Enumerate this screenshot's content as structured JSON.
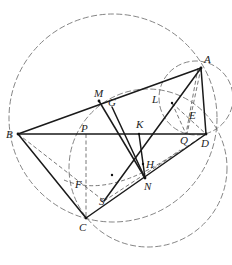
{
  "diagram": {
    "type": "geometry-construction",
    "points": {
      "A": {
        "label": "A",
        "x": 201,
        "y": 68
      },
      "B": {
        "label": "B",
        "x": 18,
        "y": 134
      },
      "C": {
        "label": "C",
        "x": 86,
        "y": 218
      },
      "D": {
        "label": "D",
        "x": 206,
        "y": 134
      },
      "M": {
        "label": "M",
        "x": 99,
        "y": 101
      },
      "G": {
        "label": "G",
        "x": 112,
        "y": 107
      },
      "K": {
        "label": "K",
        "x": 139,
        "y": 134
      },
      "H": {
        "label": "H",
        "x": 143,
        "y": 164
      },
      "N": {
        "label": "N",
        "x": 145,
        "y": 178
      },
      "L": {
        "label": "L",
        "x": 172,
        "y": 103
      },
      "E": {
        "label": "E",
        "x": 194,
        "y": 115
      },
      "Q": {
        "label": "Q",
        "x": 186,
        "y": 134
      },
      "P": {
        "label": "P",
        "x": 86,
        "y": 134
      },
      "F": {
        "label": "F",
        "x": 80,
        "y": 187
      },
      "S": {
        "label": "S",
        "x": 104,
        "y": 201
      }
    },
    "labels": [
      "A",
      "B",
      "C",
      "D",
      "M",
      "G",
      "K",
      "H",
      "N",
      "L",
      "E",
      "Q",
      "P",
      "F",
      "S"
    ],
    "solid_segments": [
      "AB",
      "BD",
      "AD",
      "BC",
      "CD",
      "MN",
      "GN",
      "KN",
      "AK",
      "KS",
      "KH"
    ],
    "dashed_segments": [
      "PC",
      "AQ",
      "BS",
      "SD",
      "LD",
      "LQ"
    ],
    "circles": [
      "circumcircle through A, B, C",
      "circle with diameter AD",
      "circle through P, Q, C"
    ]
  }
}
